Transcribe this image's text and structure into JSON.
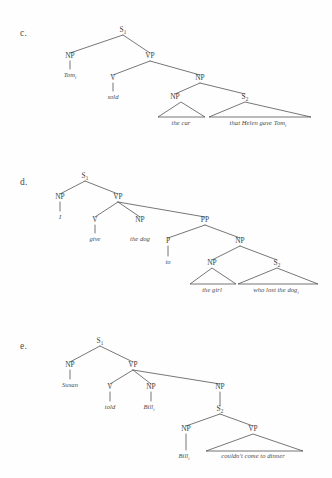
{
  "page": {
    "background": "#fefefe",
    "ink": "#3f3f3f",
    "width": 332,
    "height": 478,
    "kind": "syntax-tree-figure-set"
  },
  "figures": [
    {
      "id": "c",
      "label": "c.",
      "label_x": 20,
      "label_y": 28,
      "origin_y": 0,
      "sentence": "Tom sold the car that Helen gave Tom",
      "nodes": [
        {
          "name": "s1",
          "text": "S",
          "sub": "1",
          "x": 123,
          "y": 32
        },
        {
          "name": "np-subj",
          "text": "NP",
          "sub": "",
          "x": 70,
          "y": 58
        },
        {
          "name": "vp",
          "text": "VP",
          "sub": "",
          "x": 150,
          "y": 58
        },
        {
          "name": "v",
          "text": "V",
          "sub": "",
          "x": 113,
          "y": 80
        },
        {
          "name": "np-obj",
          "text": "NP",
          "sub": "",
          "x": 200,
          "y": 80
        },
        {
          "name": "np-inner",
          "text": "NP",
          "sub": "",
          "x": 175,
          "y": 99
        },
        {
          "name": "s2",
          "text": "S",
          "sub": "2",
          "x": 245,
          "y": 99
        }
      ],
      "branches": [
        {
          "name": "s1-np",
          "x1": 123,
          "y1": 35,
          "x2": 70,
          "y2": 53
        },
        {
          "name": "s1-vp",
          "x1": 123,
          "y1": 35,
          "x2": 150,
          "y2": 53
        },
        {
          "name": "vp-v",
          "x1": 150,
          "y1": 61,
          "x2": 113,
          "y2": 75
        },
        {
          "name": "vp-np",
          "x1": 150,
          "y1": 61,
          "x2": 200,
          "y2": 75
        },
        {
          "name": "np-npinner",
          "x1": 200,
          "y1": 83,
          "x2": 175,
          "y2": 94
        },
        {
          "name": "np-s2",
          "x1": 200,
          "y1": 83,
          "x2": 245,
          "y2": 94
        },
        {
          "name": "np-tom",
          "x1": 70,
          "y1": 61,
          "x2": 70,
          "y2": 69
        },
        {
          "name": "v-sold",
          "x1": 113,
          "y1": 83,
          "x2": 113,
          "y2": 91
        }
      ],
      "triangles": [
        {
          "name": "tri-the-car",
          "apex_x": 181,
          "apex_y": 102,
          "left_x": 158,
          "right_x": 205,
          "base_y": 117
        },
        {
          "name": "tri-that-helen",
          "apex_x": 245,
          "apex_y": 102,
          "left_x": 209,
          "right_x": 311,
          "base_y": 117
        }
      ],
      "terminals": [
        {
          "name": "terminal-tom",
          "text": "Tom",
          "sub": "i",
          "x": 70,
          "y": 77
        },
        {
          "name": "terminal-sold",
          "text": "sold",
          "sub": "",
          "x": 113,
          "y": 99
        },
        {
          "name": "terminal-the-car",
          "text": "the car",
          "sub": "",
          "x": 181,
          "y": 125
        },
        {
          "name": "terminal-that-helen-gave-tom",
          "text": "that Helen gave Tom",
          "sub": "i",
          "x": 258,
          "y": 125
        }
      ]
    },
    {
      "id": "d",
      "label": "d.",
      "label_x": 20,
      "label_y": 177,
      "origin_y": 0,
      "sentence": "I give the dog to the girl who lost the dog",
      "nodes": [
        {
          "name": "s1",
          "text": "S",
          "sub": "1",
          "x": 85,
          "y": 178
        },
        {
          "name": "np-subj",
          "text": "NP",
          "sub": "",
          "x": 60,
          "y": 199
        },
        {
          "name": "vp",
          "text": "VP",
          "sub": "",
          "x": 118,
          "y": 199
        },
        {
          "name": "v",
          "text": "V",
          "sub": "",
          "x": 95,
          "y": 222
        },
        {
          "name": "np-obj",
          "text": "NP",
          "sub": "",
          "x": 140,
          "y": 222
        },
        {
          "name": "pp",
          "text": "PP",
          "sub": "",
          "x": 205,
          "y": 222
        },
        {
          "name": "p",
          "text": "P",
          "sub": "",
          "x": 168,
          "y": 243
        },
        {
          "name": "np-pobj",
          "text": "NP",
          "sub": "",
          "x": 240,
          "y": 243
        },
        {
          "name": "np-inner",
          "text": "NP",
          "sub": "",
          "x": 212,
          "y": 265
        },
        {
          "name": "s2",
          "text": "S",
          "sub": "2",
          "x": 277,
          "y": 265
        }
      ],
      "branches": [
        {
          "name": "s1-np",
          "x1": 85,
          "y1": 181,
          "x2": 60,
          "y2": 194
        },
        {
          "name": "s1-vp",
          "x1": 85,
          "y1": 181,
          "x2": 118,
          "y2": 194
        },
        {
          "name": "vp-v",
          "x1": 118,
          "y1": 202,
          "x2": 95,
          "y2": 217
        },
        {
          "name": "vp-np",
          "x1": 118,
          "y1": 202,
          "x2": 140,
          "y2": 217
        },
        {
          "name": "vp-pp",
          "x1": 118,
          "y1": 202,
          "x2": 205,
          "y2": 217
        },
        {
          "name": "pp-p",
          "x1": 205,
          "y1": 225,
          "x2": 168,
          "y2": 238
        },
        {
          "name": "pp-np",
          "x1": 205,
          "y1": 225,
          "x2": 240,
          "y2": 238
        },
        {
          "name": "np-npinner",
          "x1": 240,
          "y1": 246,
          "x2": 212,
          "y2": 260
        },
        {
          "name": "np-s2",
          "x1": 240,
          "y1": 246,
          "x2": 277,
          "y2": 260
        },
        {
          "name": "np-i",
          "x1": 60,
          "y1": 202,
          "x2": 60,
          "y2": 211
        },
        {
          "name": "v-give",
          "x1": 95,
          "y1": 225,
          "x2": 95,
          "y2": 233
        },
        {
          "name": "p-to",
          "x1": 168,
          "y1": 246,
          "x2": 168,
          "y2": 256
        }
      ],
      "triangles": [
        {
          "name": "tri-the-girl",
          "apex_x": 212,
          "apex_y": 268,
          "left_x": 190,
          "right_x": 236,
          "base_y": 284
        },
        {
          "name": "tri-who-lost",
          "apex_x": 277,
          "apex_y": 268,
          "left_x": 238,
          "right_x": 318,
          "base_y": 284
        }
      ],
      "terminals": [
        {
          "name": "terminal-i",
          "text": "I",
          "sub": "",
          "x": 60,
          "y": 219
        },
        {
          "name": "terminal-give",
          "text": "give",
          "sub": "",
          "x": 95,
          "y": 241
        },
        {
          "name": "terminal-the-dog",
          "text": "the dog",
          "sub": "",
          "x": 140,
          "y": 241
        },
        {
          "name": "terminal-to",
          "text": "to",
          "sub": "",
          "x": 168,
          "y": 264
        },
        {
          "name": "terminal-the-girl",
          "text": "the girl",
          "sub": "",
          "x": 212,
          "y": 292
        },
        {
          "name": "terminal-who-lost-the-dog",
          "text": "who lost the dog",
          "sub": "i",
          "x": 276,
          "y": 292
        }
      ]
    },
    {
      "id": "e",
      "label": "e.",
      "label_x": 20,
      "label_y": 341,
      "origin_y": 0,
      "sentence": "Susan told Bill Bill couldn't come to dinner",
      "nodes": [
        {
          "name": "s1",
          "text": "S",
          "sub": "1",
          "x": 100,
          "y": 343
        },
        {
          "name": "np-subj",
          "text": "NP",
          "sub": "",
          "x": 70,
          "y": 367
        },
        {
          "name": "vp",
          "text": "VP",
          "sub": "",
          "x": 133,
          "y": 367
        },
        {
          "name": "v",
          "text": "V",
          "sub": "",
          "x": 110,
          "y": 389
        },
        {
          "name": "np-obj",
          "text": "NP",
          "sub": "",
          "x": 151,
          "y": 389
        },
        {
          "name": "np-comp",
          "text": "NP",
          "sub": "",
          "x": 220,
          "y": 389
        },
        {
          "name": "s2",
          "text": "S",
          "sub": "2",
          "x": 220,
          "y": 411
        },
        {
          "name": "np-embed",
          "text": "NP",
          "sub": "",
          "x": 186,
          "y": 431
        },
        {
          "name": "vp-embed",
          "text": "VP",
          "sub": "",
          "x": 253,
          "y": 431
        }
      ],
      "branches": [
        {
          "name": "s1-np",
          "x1": 100,
          "y1": 346,
          "x2": 70,
          "y2": 362
        },
        {
          "name": "s1-vp",
          "x1": 100,
          "y1": 346,
          "x2": 133,
          "y2": 362
        },
        {
          "name": "vp-v",
          "x1": 133,
          "y1": 370,
          "x2": 110,
          "y2": 384
        },
        {
          "name": "vp-np",
          "x1": 133,
          "y1": 370,
          "x2": 151,
          "y2": 384
        },
        {
          "name": "vp-npcomp",
          "x1": 133,
          "y1": 370,
          "x2": 220,
          "y2": 384
        },
        {
          "name": "npcomp-s2",
          "x1": 220,
          "y1": 392,
          "x2": 220,
          "y2": 406
        },
        {
          "name": "s2-np",
          "x1": 220,
          "y1": 414,
          "x2": 186,
          "y2": 426
        },
        {
          "name": "s2-vp",
          "x1": 220,
          "y1": 414,
          "x2": 253,
          "y2": 426
        },
        {
          "name": "np-susan",
          "x1": 70,
          "y1": 370,
          "x2": 70,
          "y2": 379
        },
        {
          "name": "v-told",
          "x1": 110,
          "y1": 392,
          "x2": 110,
          "y2": 401
        },
        {
          "name": "np-bill",
          "x1": 151,
          "y1": 392,
          "x2": 151,
          "y2": 401
        },
        {
          "name": "npembed-bill",
          "x1": 186,
          "y1": 434,
          "x2": 186,
          "y2": 450
        }
      ],
      "triangles": [
        {
          "name": "tri-couldnt-come",
          "apex_x": 253,
          "apex_y": 434,
          "left_x": 206,
          "right_x": 303,
          "base_y": 451
        }
      ],
      "terminals": [
        {
          "name": "terminal-susan",
          "text": "Susan",
          "sub": "",
          "x": 70,
          "y": 387
        },
        {
          "name": "terminal-told",
          "text": "told",
          "sub": "",
          "x": 110,
          "y": 409
        },
        {
          "name": "terminal-bill-obj",
          "text": "Bill",
          "sub": "i",
          "x": 149,
          "y": 409
        },
        {
          "name": "terminal-bill-embed",
          "text": "Bill",
          "sub": "i",
          "x": 184,
          "y": 458
        },
        {
          "name": "terminal-couldnt-come-to-dinner",
          "text": "couldn't come to dinner",
          "sub": "",
          "x": 253,
          "y": 458
        }
      ]
    }
  ]
}
